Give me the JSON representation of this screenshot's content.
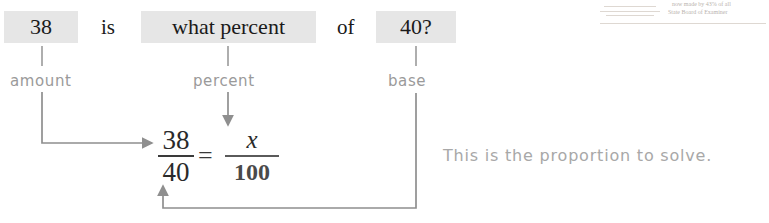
{
  "sentence": {
    "amount_value": "38",
    "is_word": "is",
    "percent_phrase": "what percent",
    "of_word": "of",
    "base_value": "40?"
  },
  "labels": {
    "amount": "amount",
    "percent": "percent",
    "base": "base"
  },
  "proportion": {
    "left_numerator": "38",
    "left_denominator": "40",
    "equals": "=",
    "right_numerator": "x",
    "right_denominator": "100"
  },
  "note": {
    "text": "This is the proportion to solve."
  },
  "artifact": {
    "line1": "now made by 43% of all",
    "line2": "State Board of Examiner"
  },
  "colors": {
    "highlight": "#e6e6e6",
    "text": "#1a1a1a",
    "label_gray": "#9a9a9a",
    "connector_line": "#8f8f8f"
  }
}
